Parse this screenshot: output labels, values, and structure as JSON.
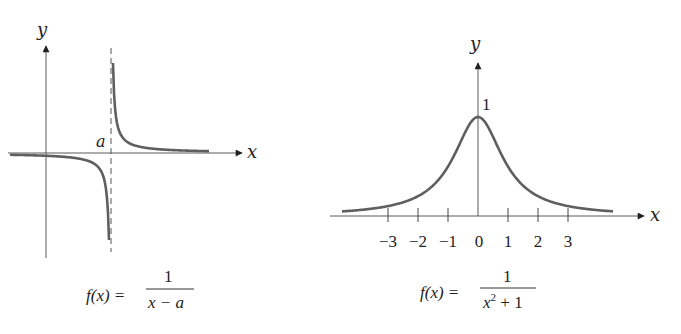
{
  "diagram": {
    "left_graph": {
      "axis_x_label": "x",
      "axis_y_label": "y",
      "asymptote_label": "a",
      "formula": {
        "lhs": "f(x) =",
        "numerator": "1",
        "denominator": "x − a"
      }
    },
    "right_graph": {
      "axis_x_label": "x",
      "axis_y_label": "y",
      "peak_label": "1",
      "tick_labels": [
        "−3",
        "−2",
        "−1",
        "0",
        "1",
        "2",
        "3"
      ],
      "formula": {
        "lhs": "f(x) =",
        "numerator": "1",
        "denominator_base": "x",
        "denominator_exp": "2",
        "denominator_rest": " + 1"
      }
    }
  },
  "chart_data": [
    {
      "type": "line",
      "title": "f(x) = 1/(x − a)",
      "xlabel": "x",
      "ylabel": "y",
      "annotations": [
        "a",
        "vertical asymptote x = a (dashed)"
      ],
      "function": "1/(x-a)",
      "grid": false
    },
    {
      "type": "line",
      "title": "f(x) = 1/(x² + 1)",
      "xlabel": "x",
      "ylabel": "y",
      "x_ticks": [
        -3,
        -2,
        -1,
        0,
        1,
        2,
        3
      ],
      "y_ticks": [
        1
      ],
      "x": [
        -4.5,
        -3,
        -2,
        -1,
        0,
        1,
        2,
        3,
        4.5
      ],
      "values": [
        0.047,
        0.1,
        0.2,
        0.5,
        1,
        0.5,
        0.2,
        0.1,
        0.047
      ],
      "function": "1/(x^2+1)",
      "xlim": [
        -5,
        5.5
      ],
      "ylim": [
        0,
        1.5
      ],
      "grid": false
    }
  ]
}
